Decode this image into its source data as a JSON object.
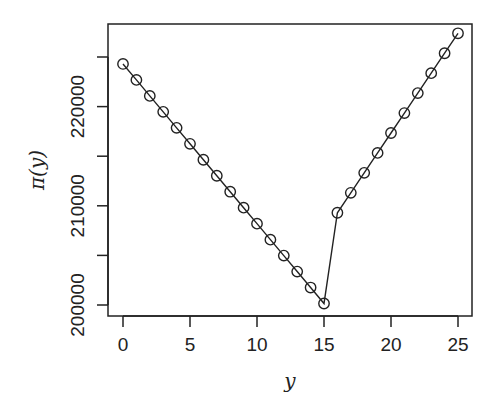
{
  "chart_data": {
    "type": "line",
    "title": "",
    "xlabel": "y",
    "ylabel": "π(y)",
    "x": [
      0,
      1,
      2,
      3,
      4,
      5,
      6,
      7,
      8,
      9,
      10,
      11,
      12,
      13,
      14,
      15,
      16,
      17,
      18,
      19,
      20,
      21,
      22,
      23,
      24,
      25
    ],
    "series": [
      {
        "name": "pi(y)",
        "marker": "open-circle",
        "values": [
          224300,
          222690,
          221080,
          219470,
          217860,
          216250,
          214640,
          213030,
          211420,
          209810,
          208200,
          206590,
          204980,
          203370,
          201760,
          200150,
          209300,
          211310,
          213320,
          215330,
          217340,
          219350,
          221360,
          223370,
          225380,
          227390
        ]
      }
    ],
    "xticks": [
      0,
      5,
      10,
      15,
      20,
      25
    ],
    "xtick_labels": [
      "0",
      "5",
      "10",
      "15",
      "20",
      "25"
    ],
    "yticks": [
      200000,
      205000,
      210000,
      215000,
      220000,
      225000
    ],
    "ytick_labels": [
      "200000",
      "210000",
      "220000"
    ],
    "xlim": [
      -0.9,
      26.2
    ],
    "ylim": [
      198900,
      228400
    ],
    "grid": false,
    "legend": null
  }
}
